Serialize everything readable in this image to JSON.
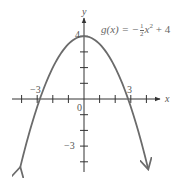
{
  "chart_data": {
    "type": "line",
    "title": "",
    "function_label": "g(x) = -½x² + 4",
    "function": {
      "a": -0.5,
      "b": 0,
      "c": 4
    },
    "xlabel": "x",
    "ylabel": "y",
    "xlim": [
      -4.1,
      4.1
    ],
    "ylim": [
      -4.4,
      4
    ],
    "x_ticks": [
      -4,
      -3,
      -2,
      -1,
      0,
      1,
      2,
      3,
      4
    ],
    "y_ticks": [
      -4,
      -3,
      -2,
      -1,
      0,
      1,
      2,
      3,
      4
    ],
    "tick_labels": {
      "x": [
        "-3",
        "0",
        "3"
      ],
      "y": [
        "4",
        "-3"
      ]
    },
    "key_points": [
      {
        "label": "vertex",
        "x": 0,
        "y": 4
      },
      {
        "label": "x-intercept",
        "x": -3,
        "y": 0
      },
      {
        "label": "x-intercept",
        "x": 3,
        "y": 0
      }
    ],
    "sample_points": [
      {
        "x": -4,
        "y": -4
      },
      {
        "x": -3,
        "y": -0.5
      },
      {
        "x": -2,
        "y": 2
      },
      {
        "x": -1,
        "y": 3.5
      },
      {
        "x": 0,
        "y": 4
      },
      {
        "x": 1,
        "y": 3.5
      },
      {
        "x": 2,
        "y": 2
      },
      {
        "x": 3,
        "y": -0.5
      },
      {
        "x": 4,
        "y": -4
      }
    ],
    "grid": false,
    "legend": "none",
    "colors": {
      "curve": "#6b6b6b",
      "axes": "#333333",
      "text": "#555555"
    }
  },
  "labels": {
    "x_axis": "x",
    "y_axis": "y",
    "tick_neg3_x": "−3",
    "tick_3_x": "3",
    "origin": "0",
    "tick_4_y": "4",
    "tick_neg3_y": "−3",
    "eq_lhs": "g(x) = −",
    "eq_num": "1",
    "eq_den": "2",
    "eq_var": "x",
    "eq_exp": "2",
    "eq_rhs": " + 4"
  }
}
